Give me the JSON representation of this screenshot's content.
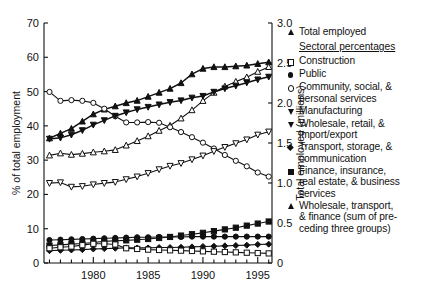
{
  "chart_data": {
    "type": "line",
    "title": "",
    "xlabel": "",
    "ylabel": "% of total employment",
    "y2label": "Total employed (millions)",
    "xlim": [
      1975.5,
      1996.3
    ],
    "ylim": [
      0,
      70
    ],
    "y2lim": [
      0,
      3.0
    ],
    "grid": false,
    "legend_position": "right",
    "xticks": [
      1980,
      1985,
      1990,
      1995
    ],
    "xtick_labels": [
      "1980",
      "1985",
      "1990",
      "1995"
    ],
    "yticks": [
      0,
      10,
      20,
      30,
      40,
      50,
      60,
      70
    ],
    "ytick_labels": [
      "0",
      "10",
      "20",
      "30",
      "40",
      "50",
      "60",
      "70"
    ],
    "y2ticks": [
      0,
      0.5,
      1.0,
      1.5,
      2.0,
      2.5,
      3.0
    ],
    "y2tick_labels": [
      "0",
      "0.5",
      "1.0",
      "1.5",
      "2.0",
      "2.5",
      "3.0"
    ],
    "x": [
      1976,
      1977,
      1978,
      1979,
      1980,
      1981,
      1982,
      1983,
      1984,
      1985,
      1986,
      1987,
      1988,
      1989,
      1990,
      1991,
      1992,
      1993,
      1994,
      1995,
      1996
    ],
    "series": [
      {
        "name": "Total employed",
        "marker": "up-triangle-filled",
        "axis": "right",
        "units": "millions",
        "values": [
          1.56,
          1.62,
          1.68,
          1.77,
          1.86,
          1.92,
          1.96,
          2.0,
          2.03,
          2.08,
          2.13,
          2.18,
          2.25,
          2.36,
          2.43,
          2.45,
          2.45,
          2.46,
          2.47,
          2.49,
          2.51
        ]
      },
      {
        "name": "Wholesale, transport, & finance (sum of preceding three groups)",
        "marker": "up-triangle-open",
        "axis": "left",
        "units": "%",
        "values": [
          31.4,
          32.0,
          31.6,
          31.9,
          32.3,
          32.6,
          33.0,
          34.3,
          35.6,
          37.0,
          38.6,
          40.1,
          42.2,
          44.6,
          47.3,
          49.7,
          51.5,
          52.9,
          54.2,
          55.8,
          57.2
        ]
      },
      {
        "name": "Community, social, & personal services",
        "marker": "circle-open",
        "axis": "left",
        "units": "%",
        "values": [
          49.9,
          47.3,
          47.5,
          47.3,
          46.7,
          45.0,
          42.8,
          41.0,
          41.0,
          41.1,
          40.9,
          39.6,
          38.2,
          36.7,
          35.1,
          33.4,
          31.5,
          29.8,
          28.2,
          26.4,
          25.2
        ]
      },
      {
        "name": "Wholesale, retail, & import/export",
        "marker": "down-triangle-open",
        "axis": "left",
        "units": "%",
        "values": [
          23.3,
          23.5,
          22.2,
          22.4,
          22.9,
          23.3,
          23.6,
          24.4,
          25.2,
          26.2,
          27.3,
          28.3,
          29.1,
          30.2,
          31.3,
          32.6,
          33.8,
          34.9,
          36.0,
          37.4,
          38.3
        ]
      },
      {
        "name": "Manufacturing",
        "marker": "down-triangle-filled",
        "axis": "left",
        "units": "%",
        "values": [
          36.2,
          36.5,
          37.4,
          38.7,
          40.3,
          41.6,
          42.9,
          43.9,
          44.8,
          45.5,
          46.2,
          46.9,
          47.4,
          48.2,
          48.7,
          49.9,
          50.9,
          51.7,
          52.6,
          53.5,
          54.3
        ]
      },
      {
        "name": "Finance, insurance, real estate, & business services",
        "marker": "square-filled",
        "axis": "left",
        "units": "%",
        "values": [
          5.1,
          5.3,
          5.5,
          5.7,
          6.0,
          6.3,
          6.5,
          6.6,
          6.8,
          7.0,
          7.3,
          7.6,
          8.0,
          8.4,
          8.8,
          9.3,
          9.8,
          10.3,
          10.9,
          11.5,
          12.1
        ]
      },
      {
        "name": "Public",
        "marker": "circle-filled",
        "axis": "left",
        "units": "%",
        "values": [
          6.7,
          6.8,
          6.9,
          7.0,
          7.1,
          7.2,
          7.3,
          7.4,
          7.5,
          7.5,
          7.6,
          7.6,
          7.6,
          7.7,
          7.7,
          7.7,
          7.7,
          7.7,
          7.7,
          7.7,
          7.7
        ]
      },
      {
        "name": "Transport, storage, & communication",
        "marker": "diamond-filled",
        "axis": "left",
        "units": "%",
        "values": [
          3.6,
          3.7,
          3.8,
          3.9,
          4.1,
          4.2,
          4.3,
          4.4,
          4.4,
          4.4,
          4.5,
          4.5,
          4.6,
          4.7,
          4.8,
          4.9,
          5.0,
          5.1,
          5.2,
          5.4,
          5.5
        ]
      },
      {
        "name": "Construction",
        "marker": "square-open",
        "axis": "left",
        "units": "%",
        "values": [
          4.3,
          4.6,
          4.8,
          5.2,
          5.6,
          5.6,
          5.4,
          4.3,
          4.1,
          3.9,
          3.8,
          3.7,
          3.6,
          3.5,
          3.4,
          3.3,
          3.2,
          3.1,
          3.0,
          2.9,
          2.8
        ]
      }
    ]
  },
  "legend": {
    "total_employed": "Total employed",
    "section_header": "Sectoral percentages",
    "items": [
      {
        "label": "Construction"
      },
      {
        "label": "Public"
      },
      {
        "label": "Community, social, &\npersonal services"
      },
      {
        "label": "Manufacturing"
      },
      {
        "label": "Wholesale, retail, &\nimport/export"
      },
      {
        "label": "Transport, storage, &\ncommunication"
      },
      {
        "label": "Finance, insurance,\nreal estate, & business\nservices"
      },
      {
        "label": "Wholesale, transport,\n& finance (sum of pre-\nceding three groups)"
      }
    ]
  },
  "colors": {
    "line": "#111111",
    "axis": "#111111",
    "background": "#ffffff"
  }
}
